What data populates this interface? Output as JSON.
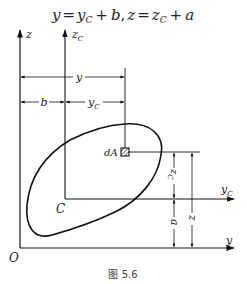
{
  "equation": {
    "text": "y = yC + b, z = zC + a",
    "parts": [
      "y",
      "=",
      "y",
      "C",
      "+",
      "b",
      ",",
      "z",
      "=",
      "z",
      "C",
      "+",
      "a"
    ]
  },
  "labels": {
    "z_axis": "z",
    "zc_axis": "z",
    "zc_sub": "C",
    "y_axis": "y",
    "yc_axis": "y",
    "yc_sub": "C",
    "origin": "O",
    "centroid": "C",
    "element": "dA",
    "dim_y": "y",
    "dim_b": "b",
    "dim_yc": "y",
    "dim_yc_sub": "C",
    "dim_zc": "z",
    "dim_zc_sub": "C",
    "dim_a": "a",
    "dim_z": "z"
  },
  "caption": "图 5.6"
}
